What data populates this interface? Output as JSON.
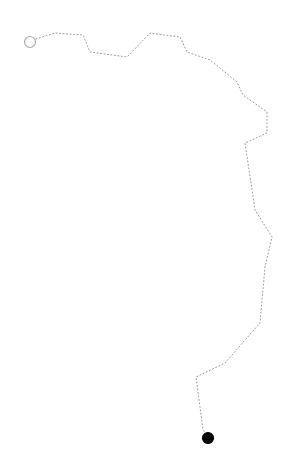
{
  "background": "#ffffff",
  "route": {
    "stroke_color": "#999999",
    "stroke_width": 1,
    "dash": "1 2.5",
    "points": [
      [
        36,
        39
      ],
      [
        55,
        33
      ],
      [
        83,
        35
      ],
      [
        90,
        52
      ],
      [
        127,
        57
      ],
      [
        150,
        33
      ],
      [
        180,
        37
      ],
      [
        187,
        52
      ],
      [
        210,
        60
      ],
      [
        237,
        82
      ],
      [
        243,
        95
      ],
      [
        267,
        112
      ],
      [
        267,
        133
      ],
      [
        245,
        143
      ],
      [
        255,
        210
      ],
      [
        272,
        237
      ],
      [
        265,
        267
      ],
      [
        260,
        323
      ],
      [
        225,
        363
      ],
      [
        196,
        377
      ],
      [
        203,
        430
      ],
      [
        208,
        436
      ]
    ]
  },
  "start_marker": {
    "cx": 30,
    "cy": 42,
    "r": 5.5,
    "fill": "#ffffff",
    "stroke": "#aaaaaa"
  },
  "end_marker": {
    "cx": 208,
    "cy": 438,
    "r": 5.5,
    "fill": "#000000",
    "stroke": "#000000"
  }
}
